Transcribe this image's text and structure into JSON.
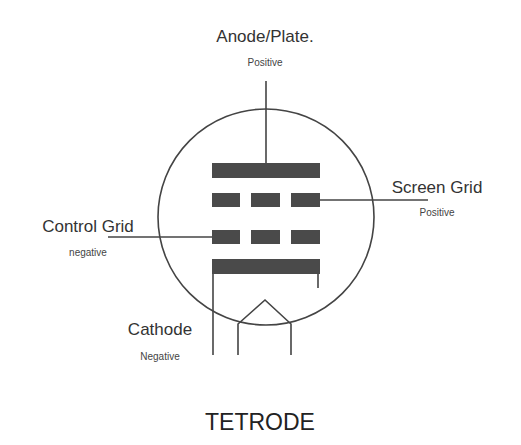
{
  "diagram": {
    "title": "TETRODE",
    "colors": {
      "line": "#444444",
      "electrode": "#4a4a4a",
      "text": "#333333",
      "background": "#ffffff"
    },
    "electrodes": {
      "anode": {
        "label": "Anode/Plate.",
        "polarity": "Positive"
      },
      "screen_grid": {
        "label": "Screen Grid",
        "polarity": "Positive"
      },
      "control_grid": {
        "label": "Control Grid",
        "polarity": "negative"
      },
      "cathode": {
        "label": "Cathode",
        "polarity": "Negative"
      }
    }
  }
}
